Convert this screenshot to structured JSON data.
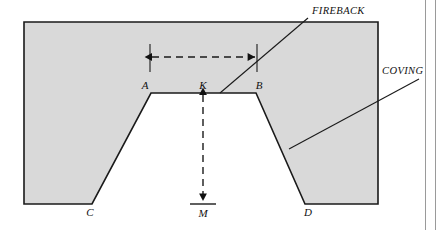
{
  "figure": {
    "background_color": "#ffffff",
    "fill_color": "#d9d9d9",
    "line_color": "#1a1a1a",
    "rule_color": "#9a9a9a"
  },
  "point_labels": [
    {
      "name": "A",
      "text": "A",
      "x": 151,
      "y": 93
    },
    {
      "name": "K",
      "text": "K",
      "x": 203,
      "y": 93
    },
    {
      "name": "B",
      "text": "B",
      "x": 256,
      "y": 93
    },
    {
      "name": "C",
      "text": "C",
      "x": 92,
      "y": 204
    },
    {
      "name": "D",
      "text": "D",
      "x": 305,
      "y": 204
    },
    {
      "name": "M",
      "text": "M",
      "x": 203,
      "y": 204
    }
  ],
  "callouts": [
    {
      "name": "fireback",
      "text": "FIREBACK",
      "label_x": 312,
      "label_y": 14,
      "leader_from_x": 308,
      "leader_from_y": 18,
      "leader_to_x": 220,
      "leader_to_y": 93
    },
    {
      "name": "coving",
      "text": "COVING",
      "label_x": 382,
      "label_y": 74,
      "leader_from_x": 419,
      "leader_from_y": 79,
      "leader_to_x": 289,
      "leader_to_y": 149
    }
  ],
  "dimensions": [
    {
      "name": "width-AB",
      "orientation": "horizontal",
      "from_x": 150,
      "from_y": 57,
      "to_x": 257,
      "to_y": 57,
      "style": "dashed-double-arrow"
    },
    {
      "name": "depth-KM",
      "orientation": "vertical",
      "from_x": 203,
      "from_y": 93,
      "to_x": 203,
      "to_y": 203,
      "style": "dashed-double-arrow"
    }
  ],
  "outline": {
    "name": "hearth-section-outline",
    "points": "24,22 378,22 378,204 305,204 256,93 151,93 92,204 24,204"
  },
  "side_rules": [
    {
      "name": "page-rule-inner",
      "x": 425
    },
    {
      "name": "page-rule-outer",
      "x": 435
    }
  ]
}
